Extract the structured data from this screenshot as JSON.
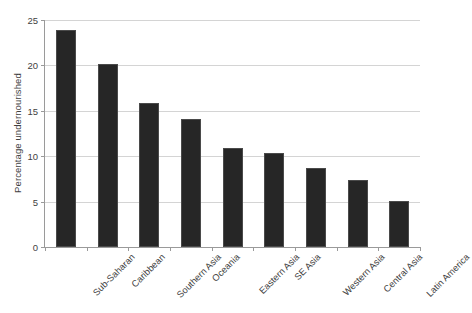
{
  "chart_data": {
    "type": "bar",
    "title": "",
    "subtitle": "",
    "xlabel": "",
    "ylabel": "Percentage undernourished",
    "categories": [
      "Sub-Saharan",
      "Caribbean",
      "Southern Asia",
      "Oceania",
      "Eastern Asia",
      "SE Asia",
      "Western Asia",
      "Central Asia",
      "Latin America"
    ],
    "values": [
      23.9,
      20.2,
      15.9,
      14.1,
      10.9,
      10.3,
      8.7,
      7.4,
      5.1
    ],
    "ylim": [
      0,
      25
    ],
    "yticks": [
      0,
      5,
      10,
      15,
      20,
      25
    ],
    "ytick_labels": [
      "0",
      "5",
      "10",
      "15",
      "20",
      "25"
    ],
    "grid": "horizontal",
    "legend": "none",
    "bar_color": "#262626",
    "gridline_color": "#d4d4d4",
    "axis_color": "#9a9a9a",
    "background_color": "#ffffff",
    "label_rotation": -45
  }
}
